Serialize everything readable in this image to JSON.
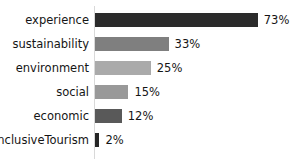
{
  "chart_data": {
    "type": "bar",
    "orientation": "horizontal",
    "title": "",
    "xlabel": "",
    "ylabel": "",
    "xlim": [
      0,
      73
    ],
    "grid": false,
    "legend": null,
    "categories": [
      "experience",
      "sustainability",
      "environment",
      "social",
      "economic",
      "InclusiveTourism"
    ],
    "values": [
      73,
      33,
      25,
      15,
      12,
      2
    ],
    "value_labels": [
      "73%",
      "33%",
      "25%",
      "15%",
      "12%",
      "2%"
    ],
    "bar_colors": [
      "#2b2b2b",
      "#7f7f7f",
      "#aaaaaa",
      "#999999",
      "#595959",
      "#262626"
    ],
    "bars": [
      {
        "label": "experience",
        "value": 73,
        "value_label": "73%",
        "color": "#2b2b2b"
      },
      {
        "label": "sustainability",
        "value": 33,
        "value_label": "33%",
        "color": "#7f7f7f"
      },
      {
        "label": "environment",
        "value": 25,
        "value_label": "25%",
        "color": "#aaaaaa"
      },
      {
        "label": "social",
        "value": 15,
        "value_label": "15%",
        "color": "#999999"
      },
      {
        "label": "economic",
        "value": 12,
        "value_label": "12%",
        "color": "#595959"
      },
      {
        "label": "InclusiveTourism",
        "value": 2,
        "value_label": "2%",
        "color": "#262626"
      }
    ]
  },
  "axis": {
    "line_color": "#d9d9d9"
  },
  "scale": {
    "px_per_unit": 2.23,
    "max_value": 73
  }
}
